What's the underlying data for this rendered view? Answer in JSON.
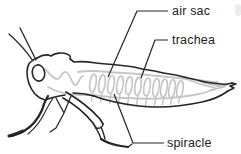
{
  "diagram": {
    "labels": {
      "air_sac": "air sac",
      "trachea": "trachea",
      "spiracle": "spiracle"
    },
    "colors": {
      "outline": "#262626",
      "tracheal_gray": "#c6c6c6",
      "background": "#ffffff",
      "text": "#222222"
    }
  }
}
